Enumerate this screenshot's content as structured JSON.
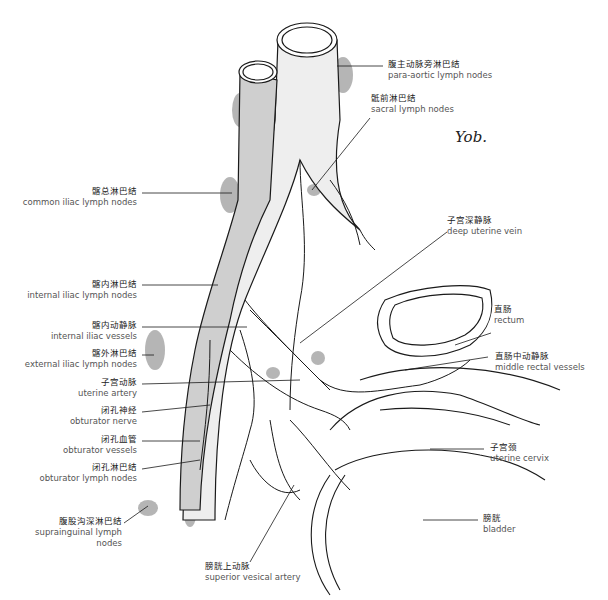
{
  "figure": {
    "signature": "Yob.",
    "colors": {
      "line": "#1a1a1a",
      "vessel_fill": "#eeeeee",
      "vein_fill": "#cfcfcf",
      "lymph_node": "#a9a9a9",
      "label_text": "#333333"
    }
  },
  "labels": [
    {
      "id": "para-aortic",
      "zh": "腹主动脉旁淋巴结",
      "en": "para-aortic lymph nodes"
    },
    {
      "id": "sacral",
      "zh": "骶前淋巴结",
      "en": "sacral lymph nodes"
    },
    {
      "id": "common-iliac",
      "zh": "髂总淋巴结",
      "en": "common iliac lymph nodes"
    },
    {
      "id": "deep-uterine-vein",
      "zh": "子宫深静脉",
      "en": "deep uterine vein"
    },
    {
      "id": "internal-iliac-nodes",
      "zh": "髂内淋巴结",
      "en": "internal iliac lymph nodes"
    },
    {
      "id": "internal-iliac-vessels",
      "zh": "髂内动静脉",
      "en": "internal iliac vessels"
    },
    {
      "id": "external-iliac",
      "zh": "髂外淋巴结",
      "en": "external iliac lymph nodes"
    },
    {
      "id": "rectum",
      "zh": "直肠",
      "en": "rectum"
    },
    {
      "id": "middle-rectal",
      "zh": "直肠中动静脉",
      "en": "middle rectal vessels"
    },
    {
      "id": "uterine-artery",
      "zh": "子宫动脉",
      "en": "uterine artery"
    },
    {
      "id": "obturator-nerve",
      "zh": "闭孔神经",
      "en": "obturator nerve"
    },
    {
      "id": "obturator-vessels",
      "zh": "闭孔血管",
      "en": "obturator vessels"
    },
    {
      "id": "obturator-nodes",
      "zh": "闭孔淋巴结",
      "en": "obturator lymph nodes"
    },
    {
      "id": "uterine-cervix",
      "zh": "子宫颈",
      "en": "uterine cervix"
    },
    {
      "id": "suprainguinal",
      "zh": "腹股沟深淋巴结",
      "en": "suprainguinal lymph nodes"
    },
    {
      "id": "bladder",
      "zh": "膀胱",
      "en": "bladder"
    },
    {
      "id": "superior-vesical",
      "zh": "膀胱上动脉",
      "en": "superior vesical artery"
    }
  ]
}
